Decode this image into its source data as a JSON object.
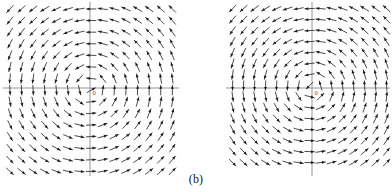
{
  "figure": {
    "caption": "(b)",
    "panel_count": 2,
    "background_color": "#ffffff",
    "arrow_color": "#2b2b2b",
    "axis_color": "#8a8a8a"
  },
  "chart_data": [
    {
      "type": "quiver",
      "name": "left-direction-field",
      "title": "",
      "xlabel": "",
      "ylabel": "",
      "origin_label": "0",
      "grid": false,
      "legend": "none",
      "xlim": [
        -8,
        8
      ],
      "ylim": [
        -8,
        8
      ],
      "grid_nx": 15,
      "grid_ny": 15,
      "field": "rotational-spiral",
      "rotation": "counterclockwise",
      "radial_component": -0.18,
      "angular_component": 1.0,
      "arrow_length_px": 9.5,
      "pixel_geometry": {
        "plot_left": 3,
        "plot_top": 2,
        "plot_width": 176,
        "plot_height": 174,
        "axis_x_px": 90,
        "axis_y_px": 88,
        "spacing_px": 11.6
      }
    },
    {
      "type": "quiver",
      "name": "right-direction-field",
      "title": "",
      "xlabel": "",
      "ylabel": "",
      "origin_label": "0",
      "grid": false,
      "legend": "none",
      "xlim": [
        -8,
        8
      ],
      "ylim": [
        -8,
        8
      ],
      "grid_nx": 15,
      "grid_ny": 15,
      "field": "rotational-spiral",
      "rotation": "counterclockwise",
      "radial_component": -0.12,
      "angular_component": 1.0,
      "arrow_length_px": 9.5,
      "pixel_geometry": {
        "plot_left": 226,
        "plot_top": 2,
        "plot_width": 164,
        "plot_height": 174,
        "axis_x_px": 312,
        "axis_y_px": 88,
        "spacing_px": 11.0
      }
    }
  ]
}
